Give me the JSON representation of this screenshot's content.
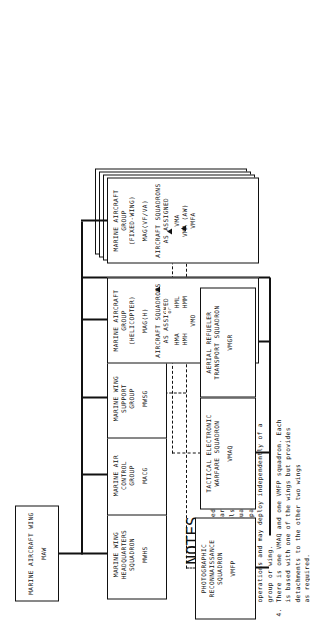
{
  "chart_title": "Marine Aircraft Wing Organization",
  "nodes": {
    "maw": {
      "lines": [
        "MARINE AIRCRAFT WING"
      ],
      "code": "MAW"
    },
    "mwhs": {
      "lines": [
        "MARINE WING",
        "HEADQUARTERS",
        "SQUADRON"
      ],
      "code": "MWHS"
    },
    "macg": {
      "lines": [
        "MARINE AIR",
        "CONTROL",
        "GROUP"
      ],
      "code": "MACG"
    },
    "mwsg": {
      "lines": [
        "MARINE WING",
        "SUPPORT",
        "GROUP"
      ],
      "code": "MWSG"
    },
    "mag_h": {
      "lines": [
        "MARINE AIRCRAFT",
        "GROUP",
        "(HELICOPTER)"
      ],
      "code": "MAG(H)",
      "assigned_label": [
        "AIRCRAFT SQUADRONS",
        "AS ASSIGNED"
      ],
      "assigned": [
        "HMA      HML",
        "HMH      HMM",
        "VMO"
      ]
    },
    "mag_fw": {
      "lines": [
        "MARINE AIRCRAFT",
        "GROUP",
        "(FIXED-WING)"
      ],
      "code": "MAG(VF/VA)",
      "assigned_label": [
        "AIRCRAFT SQUADRONS",
        "AS ASSIGNED"
      ],
      "assigned": [
        "VMA",
        "VMA (AW)",
        "VMFA"
      ]
    },
    "vmgr": {
      "lines": [
        "AERIAL REFUELER",
        "TRANSPORT SQUADRON"
      ],
      "code": "VMGR"
    },
    "vmaq": {
      "lines": [
        "TACTICAL ELECTRONIC",
        "WARFARE SQUADRON"
      ],
      "code": "VMAQ"
    },
    "vmfp": {
      "lines": [
        "PHOTOGRAPHIC",
        "RECONNAISSANCE",
        "SQUADRON"
      ],
      "code": "VMFP"
    }
  },
  "connector_labels": {
    "or": "or"
  },
  "notes": {
    "title": "NOTES",
    "items": [
      {
        "num": "1.",
        "text": "Wings are task oriented and the number of aircraft\ngroups in each wing varies accordingly."
      },
      {
        "num": "2.",
        "text": "Aircraft groups are also task oriented and the\nnumber of aircraft squadrons in each MAG varies."
      },
      {
        "num": "3.",
        "text": "VMGR squadrons are capable of independent\noperations and may deploy independently of a\ngroup or wing."
      },
      {
        "num": "4.",
        "text": "There is one VMAQ and one VMFP squadron. Each\nis based with one of the wings but provides\ndetachments to the other two wings\nas required."
      }
    ]
  },
  "colors": {
    "line": "#111111",
    "background": "#ffffff"
  }
}
